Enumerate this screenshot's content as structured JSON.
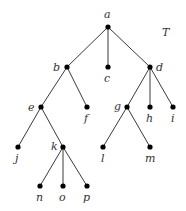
{
  "diagram": {
    "type": "rooted-tree",
    "title": "T",
    "nodes": [
      {
        "id": "a",
        "label": "a",
        "x": 108,
        "y": 27,
        "lx": 104,
        "ly": 18
      },
      {
        "id": "b",
        "label": "b",
        "x": 67,
        "y": 67,
        "lx": 53,
        "ly": 71
      },
      {
        "id": "c",
        "label": "c",
        "x": 108,
        "y": 67,
        "lx": 104,
        "ly": 82
      },
      {
        "id": "d",
        "label": "d",
        "x": 150,
        "y": 67,
        "lx": 156,
        "ly": 71
      },
      {
        "id": "e",
        "label": "e",
        "x": 41,
        "y": 107,
        "lx": 28,
        "ly": 111
      },
      {
        "id": "f",
        "label": "f",
        "x": 87,
        "y": 107,
        "lx": 84,
        "ly": 122
      },
      {
        "id": "g",
        "label": "g",
        "x": 127,
        "y": 107,
        "lx": 114,
        "ly": 110
      },
      {
        "id": "h",
        "label": "h",
        "x": 150,
        "y": 107,
        "lx": 146,
        "ly": 122
      },
      {
        "id": "i",
        "label": "i",
        "x": 173,
        "y": 107,
        "lx": 171,
        "ly": 122
      },
      {
        "id": "j",
        "label": "j",
        "x": 18,
        "y": 147,
        "lx": 15,
        "ly": 162
      },
      {
        "id": "k",
        "label": "k",
        "x": 63,
        "y": 147,
        "lx": 51,
        "ly": 150
      },
      {
        "id": "l",
        "label": "l",
        "x": 103,
        "y": 147,
        "lx": 101,
        "ly": 162
      },
      {
        "id": "m",
        "label": "m",
        "x": 150,
        "y": 147,
        "lx": 145,
        "ly": 162
      },
      {
        "id": "n",
        "label": "n",
        "x": 40,
        "y": 186,
        "lx": 36,
        "ly": 201
      },
      {
        "id": "o",
        "label": "o",
        "x": 63,
        "y": 186,
        "lx": 59,
        "ly": 201
      },
      {
        "id": "p",
        "label": "p",
        "x": 87,
        "y": 186,
        "lx": 83,
        "ly": 201
      }
    ],
    "edges": [
      [
        "a",
        "b"
      ],
      [
        "a",
        "c"
      ],
      [
        "a",
        "d"
      ],
      [
        "b",
        "e"
      ],
      [
        "b",
        "f"
      ],
      [
        "d",
        "g"
      ],
      [
        "d",
        "h"
      ],
      [
        "d",
        "i"
      ],
      [
        "e",
        "j"
      ],
      [
        "e",
        "k"
      ],
      [
        "g",
        "l"
      ],
      [
        "g",
        "m"
      ],
      [
        "k",
        "n"
      ],
      [
        "k",
        "o"
      ],
      [
        "k",
        "p"
      ]
    ]
  }
}
